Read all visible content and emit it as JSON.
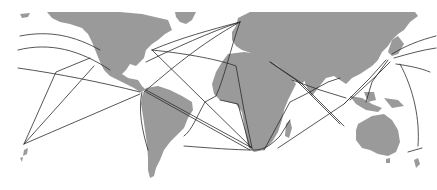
{
  "map": {
    "width": 437,
    "height": 190,
    "background": "#ffffff",
    "land_color": "#9a9a9a",
    "route_color": "#2b2b2b",
    "route_width": 0.8,
    "lakes_color": "#ffffff"
  },
  "landmasses": [
    {
      "name": "north-america",
      "d": "M20 14 L30 13 L28 17 L22 18 Z M47 12 L120 12 L142 14 L168 20 L172 30 L165 34 L158 40 L152 44 L146 50 L144 58 L140 62 L136 66 L130 64 L126 70 L122 74 L128 78 L138 80 L142 86 L146 90 L140 92 L134 88 L126 84 L118 80 L110 76 L104 70 L100 62 L96 52 L92 42 L88 34 L82 28 L70 24 L60 22 L52 18 Z"
    },
    {
      "name": "greenland",
      "d": "M175 12 L196 12 L192 20 L186 24 L180 22 L176 17 Z"
    },
    {
      "name": "south-america",
      "d": "M146 88 L158 86 L170 90 L182 96 L192 102 L193 110 L188 118 L184 128 L178 134 L170 142 L164 150 L160 160 L156 168 L154 176 L150 178 L148 170 L148 158 L147 144 L145 130 L143 116 L141 104 L142 96 Z"
    },
    {
      "name": "europe-asia",
      "d": "M238 18 L250 12 L415 12 L418 16 L410 22 L404 30 L398 34 L392 40 L388 46 L382 52 L378 60 L372 66 L366 70 L360 74 L352 78 L346 84 L340 80 L334 76 L326 78 L318 88 L312 96 L308 90 L304 80 L298 76 L290 74 L282 70 L276 64 L270 60 L262 56 L254 54 L248 52 L242 50 L236 46 L232 40 L232 32 L236 26 Z"
    },
    {
      "name": "africa",
      "d": "M228 54 L244 52 L260 54 L272 60 L282 70 L290 76 L296 84 L292 92 L288 100 L284 110 L282 120 L278 132 L272 142 L264 150 L254 152 L248 146 L246 136 L244 124 L242 112 L236 104 L228 102 L220 100 L214 94 L212 84 L216 72 L222 62 Z"
    },
    {
      "name": "madagascar",
      "d": "M286 124 L290 120 L292 128 L289 138 L285 136 Z"
    },
    {
      "name": "arabia",
      "d": "M280 66 L300 68 L308 76 L302 84 L294 80 L286 74 Z"
    },
    {
      "name": "japan",
      "d": "M392 40 L398 36 L404 44 L398 54 L392 56 L388 52 Z"
    },
    {
      "name": "indonesia",
      "d": "M350 96 L362 98 L372 104 L382 108 L378 112 L366 110 L356 104 Z M364 92 L374 92 L376 100 L368 102 Z M384 98 L398 100 L404 106 L392 108 Z"
    },
    {
      "name": "australia",
      "d": "M358 124 L372 116 L384 114 L392 120 L398 130 L400 142 L396 152 L388 156 L378 154 L370 150 L362 148 L356 140 L356 130 Z"
    },
    {
      "name": "tasmania",
      "d": "M386 159 L390 158 L390 163 L386 163 Z"
    },
    {
      "name": "new-zealand",
      "d": "M414 160 L418 158 L420 164 L416 168 Z"
    },
    {
      "name": "hawaii-tonga",
      "d": "M24 150 L28 148 L27 154 L23 156 Z M20 158 L23 157 L22 162 Z"
    }
  ],
  "routes": [
    {
      "name": "north-pacific-1",
      "d": "M20 36 C50 30 75 36 100 50"
    },
    {
      "name": "north-pacific-2",
      "d": "M18 50 C50 42 80 50 110 70"
    },
    {
      "name": "central-pacific",
      "d": "M18 68 C60 74 100 82 140 92"
    },
    {
      "name": "pacific-fan-1",
      "d": "M24 144 L56 72 L90 58"
    },
    {
      "name": "pacific-fan-2",
      "d": "M24 144 L94 66"
    },
    {
      "name": "pacific-fan-3",
      "d": "M24 144 L140 94"
    },
    {
      "name": "panama-westcoast",
      "d": "M142 92 C138 110 142 130 148 150"
    },
    {
      "name": "transatlantic-north",
      "d": "M152 50 C180 38 210 30 240 22"
    },
    {
      "name": "us-to-europe",
      "d": "M146 62 C175 48 210 32 240 22"
    },
    {
      "name": "panama-to-europe",
      "d": "M144 92 C170 70 200 44 240 22"
    },
    {
      "name": "ny-to-cape",
      "d": "M152 50 L252 148"
    },
    {
      "name": "caribbean-to-cape-1",
      "d": "M146 90 L252 148"
    },
    {
      "name": "caribbean-to-cape-2",
      "d": "M146 92 L250 150"
    },
    {
      "name": "atlantic-diag",
      "d": "M152 50 C190 54 220 60 236 66 L244 110 L252 148"
    },
    {
      "name": "europe-to-brazil",
      "d": "M240 22 C230 50 225 76 216 96 L205 102 C196 118 192 130 184 136"
    },
    {
      "name": "africa-westcoast",
      "d": "M220 100 L238 104 L250 148"
    },
    {
      "name": "south-atlantic",
      "d": "M184 146 C210 148 235 150 254 150 C265 150 272 144 280 136 L290 120"
    },
    {
      "name": "cape-to-asia",
      "d": "M264 150 L290 102 L306 94 L328 82 L340 78"
    },
    {
      "name": "cape-to-indonesia",
      "d": "M278 148 L344 104 L352 96"
    },
    {
      "name": "suez-to-asia-1",
      "d": "M270 62 L296 80 L340 124"
    },
    {
      "name": "suez-to-asia-2",
      "d": "M270 62 L300 82 L344 126"
    },
    {
      "name": "india-to-se-asia",
      "d": "M292 80 L320 90 L346 98"
    },
    {
      "name": "se-asia-to-japan-1",
      "d": "M344 104 L370 78 L386 60"
    },
    {
      "name": "se-asia-to-japan-2",
      "d": "M350 100 L376 76 L390 62"
    },
    {
      "name": "indonesia-to-japan",
      "d": "M366 102 L372 82 L388 60"
    },
    {
      "name": "japan-pacific-1",
      "d": "M392 54 C405 46 420 40 436 36"
    },
    {
      "name": "japan-pacific-2",
      "d": "M394 58 C408 54 422 50 436 48"
    },
    {
      "name": "japan-pacific-3",
      "d": "M396 64 C410 66 420 68 430 72"
    },
    {
      "name": "japan-to-australia",
      "d": "M400 64 C414 90 420 120 418 146"
    },
    {
      "name": "nz-link",
      "d": "M408 152 L422 148"
    }
  ]
}
